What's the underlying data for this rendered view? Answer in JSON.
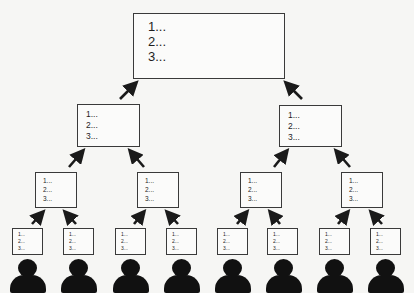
{
  "diagram": {
    "type": "hierarchy-aggregation",
    "levels": [
      {
        "level": 1,
        "boxes": [
          {
            "items": [
              "1...",
              "2...",
              "3..."
            ]
          }
        ]
      },
      {
        "level": 2,
        "boxes": [
          {
            "items": [
              "1...",
              "2...",
              "3..."
            ]
          },
          {
            "items": [
              "1...",
              "2...",
              "3..."
            ]
          }
        ]
      },
      {
        "level": 3,
        "boxes": [
          {
            "items": [
              "1...",
              "2...",
              "3..."
            ]
          },
          {
            "items": [
              "1...",
              "2...",
              "3..."
            ]
          },
          {
            "items": [
              "1...",
              "2...",
              "3..."
            ]
          },
          {
            "items": [
              "1...",
              "2...",
              "3..."
            ]
          }
        ]
      },
      {
        "level": 4,
        "boxes": [
          {
            "items": [
              "1...",
              "2...",
              "3..."
            ]
          },
          {
            "items": [
              "1...",
              "2...",
              "3..."
            ]
          },
          {
            "items": [
              "1...",
              "2...",
              "3..."
            ]
          },
          {
            "items": [
              "1...",
              "2...",
              "3..."
            ]
          },
          {
            "items": [
              "1...",
              "2...",
              "3..."
            ]
          },
          {
            "items": [
              "1...",
              "2...",
              "3..."
            ]
          },
          {
            "items": [
              "1...",
              "2...",
              "3..."
            ]
          },
          {
            "items": [
              "1...",
              "2...",
              "3..."
            ]
          }
        ]
      }
    ],
    "people_count": 8,
    "person_icon": "person-silhouette-icon",
    "arrow_color": "#1a1a1a",
    "box_border_color": "#3a3a3a"
  }
}
